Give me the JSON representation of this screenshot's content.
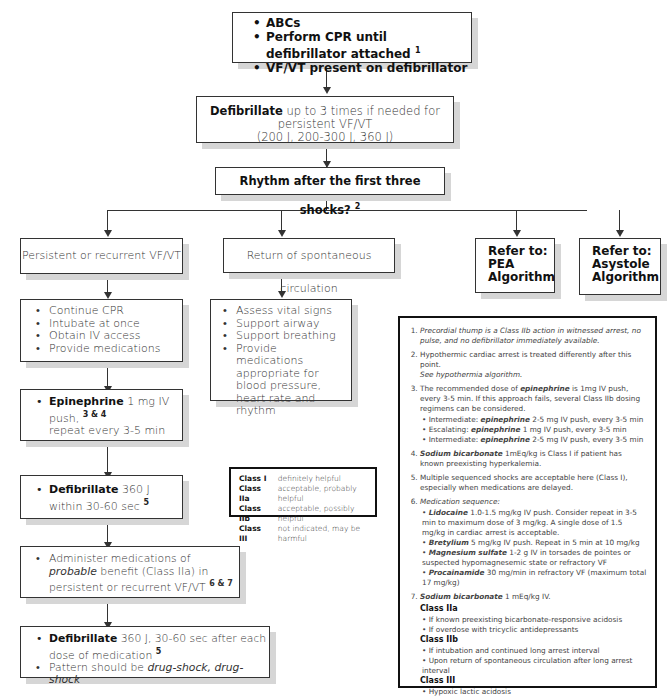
{
  "start": {
    "items": [
      "ABCs",
      "Perform CPR until defibrillator attached",
      "VF/VT present on defibrillator"
    ],
    "footnote": "1"
  },
  "defib_initial": {
    "bold": "Defibrillate",
    "text": "up to 3 times if needed for persistent VF/VT",
    "line2": "(200 J, 200-300 J, 360 J)"
  },
  "rhythm_question": {
    "text": "Rhythm after the first three shocks?",
    "footnote": "2"
  },
  "branches": {
    "persistent": "Persistent or recurrent VF/VT",
    "rosc": "Return of spontaneous circulation",
    "pea": [
      "Refer to:",
      "PEA",
      "Algorithm"
    ],
    "asystole": [
      "Refer to:",
      "Asystole",
      "Algorithm"
    ]
  },
  "left_steps": {
    "actions": [
      "Continue CPR",
      "Intubate at once",
      "Obtain IV access",
      "Provide medications"
    ],
    "epinephrine": {
      "bold": "Epinephrine",
      "text": "1 mg IV push,",
      "footnote": "3 & 4",
      "line2": "repeat every 3-5 min"
    },
    "defib_360": {
      "bold": "Defibrillate",
      "text": "360 J",
      "line2": "within 30-60 sec",
      "footnote": "5"
    },
    "class_iia": {
      "text1": "Administer medications of",
      "italic": "probable",
      "text2": "benefit (Class IIa) in persistent or recurrent VF/VT",
      "footnote": "6 & 7"
    },
    "final": {
      "bold": "Defibrillate",
      "text": "360 J, 30-60 sec after each dose of medication",
      "footnote": "5",
      "pattern_prefix": "Pattern should be",
      "pattern_italic": "drug-shock, drug-shock"
    }
  },
  "rosc_steps": [
    "Assess vital signs",
    "Support airway",
    "Support breathing",
    "Provide medications appropriate for blood pressure, heart rate and rhythm"
  ],
  "legend": [
    {
      "cls": "Class I",
      "desc": "definitely helpful"
    },
    {
      "cls": "Class IIa",
      "desc": "acceptable, probably helpful"
    },
    {
      "cls": "Class IIb",
      "desc": "acceptable, possibly helpful"
    },
    {
      "cls": "Class III",
      "desc": "not indicated, may be harmful"
    }
  ],
  "notes": {
    "n1": "Precordial thump is a Class IIb action in witnessed arrest, no pulse, and no defibrillator immediately available.",
    "n2a": "Hypothermic cardiac arrest is treated differently after this point.",
    "n2b": "See hypothermia algorithm.",
    "n3a": "The recommended dose of",
    "n3b": "epinephrine",
    "n3c": "is 1mg IV push, every 3-5 min. If this approach fails, several Class IIb dosing regimens can be considered.",
    "n3_sub": [
      {
        "pre": "Intermediate:",
        "drug": "epinephrine",
        "post": "2-5 mg IV push, every 3-5 min"
      },
      {
        "pre": "Escalating:",
        "drug": "epinephrine",
        "post": "1 mg IV push, every 3-5 min"
      },
      {
        "pre": "Intermediate:",
        "drug": "epinephrine",
        "post": "2-5 mg IV push, every 3-5 min"
      }
    ],
    "n4a": "Sodium bicarbonate",
    "n4b": "1mEq/kg is Class I if patient has known preexisting hyperkalemia.",
    "n5": "Multiple sequenced shocks are acceptable here (Class I), especially when medications are delayed.",
    "n6": "Medication sequence:",
    "n6_sub": [
      {
        "drug": "Lidocaine",
        "post": "1.0-1.5 mg/kg IV push. Consider repeat in 3-5 min to maximum dose of 3 mg/kg. A single dose of 1.5 mg/kg in cardiac arrest is acceptable."
      },
      {
        "drug": "Bretylium",
        "post": "5 mg/kg IV push. Repeat in 5 min at 10 mg/kg"
      },
      {
        "drug": "Magnesium sulfate",
        "post": "1-2 g IV in torsades de pointes or suspected hypomagnesemic state or refractory VF"
      },
      {
        "drug": "Procainamide",
        "post": "30 mg/min in refractory VF (maximum total 17 mg/kg)"
      }
    ],
    "n7a": "Sodium bicarbonate",
    "n7b": "1 mEq/kg IV.",
    "n7_groups": [
      {
        "cls": "Class IIa",
        "items": [
          "If known preexisting bicarbonate-responsive acidosis",
          "If overdose with tricyclic antidepressants"
        ]
      },
      {
        "cls": "Class IIb",
        "items": [
          "If intubation and continued long arrest interval",
          "Upon return of spontaneous circulation after long arrest interval"
        ]
      },
      {
        "cls": "Class III",
        "items": [
          "Hypoxic lactic acidosis"
        ]
      }
    ]
  }
}
